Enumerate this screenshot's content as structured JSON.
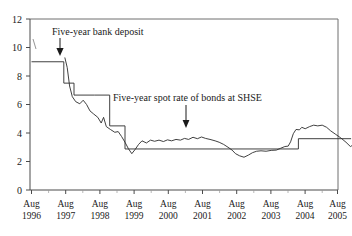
{
  "chart_data": {
    "type": "line",
    "title": "",
    "xlabel": "",
    "ylabel": "",
    "ylim": [
      0,
      12
    ],
    "yticks": [
      0,
      2,
      4,
      6,
      8,
      10,
      12
    ],
    "grid": false,
    "legend_position": "annotations-inline",
    "xlabels_line1": [
      "Aug",
      "Aug",
      "Aug",
      "Aug",
      "Aug",
      "Aug",
      "Aug",
      "Aug",
      "Aug",
      "Aug"
    ],
    "xlabels_line2": [
      "1996",
      "1997",
      "1998",
      "1999",
      "2000",
      "2001",
      "2002",
      "2003",
      "2004",
      "2005"
    ],
    "x_categories": [
      "Aug 1996",
      "Aug 1997",
      "Aug 1998",
      "Aug 1999",
      "Aug 2000",
      "Aug 2001",
      "Aug 2002",
      "Aug 2003",
      "Aug 2004",
      "Aug 2005"
    ],
    "annotations": [
      {
        "name": "five-year-bank-deposit",
        "text": "Five-year bank deposit",
        "arrow": "down"
      },
      {
        "name": "five-year-spot-rate",
        "text": "Five-year spot rate of bonds at SHSE",
        "arrow": "down"
      }
    ],
    "series": [
      {
        "name": "Five-year bank deposit",
        "style": "step",
        "points": [
          [
            0.0,
            9.0
          ],
          [
            0.95,
            9.0
          ],
          [
            0.95,
            7.5
          ],
          [
            1.25,
            7.5
          ],
          [
            1.25,
            6.66
          ],
          [
            1.85,
            6.66
          ],
          [
            1.85,
            6.66
          ],
          [
            2.3,
            6.66
          ],
          [
            2.3,
            4.5
          ],
          [
            2.75,
            4.5
          ],
          [
            2.75,
            2.88
          ],
          [
            7.85,
            2.88
          ],
          [
            7.85,
            3.6
          ],
          [
            9.4,
            3.6
          ]
        ]
      },
      {
        "name": "Five-year spot rate of bonds at SHSE",
        "style": "line",
        "points": [
          [
            0.98,
            9.3
          ],
          [
            1.05,
            8.6
          ],
          [
            1.12,
            7.3
          ],
          [
            1.2,
            6.55
          ],
          [
            1.3,
            6.2
          ],
          [
            1.42,
            6.05
          ],
          [
            1.52,
            6.3
          ],
          [
            1.62,
            6.0
          ],
          [
            1.72,
            5.55
          ],
          [
            1.82,
            5.35
          ],
          [
            1.95,
            5.1
          ],
          [
            2.05,
            4.7
          ],
          [
            2.12,
            5.1
          ],
          [
            2.2,
            4.45
          ],
          [
            2.32,
            4.25
          ],
          [
            2.45,
            4.05
          ],
          [
            2.55,
            4.1
          ],
          [
            2.65,
            3.75
          ],
          [
            2.75,
            3.35
          ],
          [
            2.85,
            2.9
          ],
          [
            2.95,
            2.55
          ],
          [
            3.05,
            2.85
          ],
          [
            3.15,
            3.2
          ],
          [
            3.25,
            3.45
          ],
          [
            3.38,
            3.3
          ],
          [
            3.5,
            3.5
          ],
          [
            3.62,
            3.42
          ],
          [
            3.75,
            3.5
          ],
          [
            3.88,
            3.4
          ],
          [
            4.0,
            3.52
          ],
          [
            4.12,
            3.45
          ],
          [
            4.25,
            3.55
          ],
          [
            4.38,
            3.5
          ],
          [
            4.5,
            3.62
          ],
          [
            4.62,
            3.55
          ],
          [
            4.75,
            3.7
          ],
          [
            4.88,
            3.6
          ],
          [
            5.0,
            3.72
          ],
          [
            5.12,
            3.62
          ],
          [
            5.25,
            3.55
          ],
          [
            5.4,
            3.45
          ],
          [
            5.52,
            3.35
          ],
          [
            5.65,
            3.2
          ],
          [
            5.78,
            3.0
          ],
          [
            5.9,
            2.8
          ],
          [
            6.0,
            2.55
          ],
          [
            6.12,
            2.4
          ],
          [
            6.25,
            2.3
          ],
          [
            6.38,
            2.45
          ],
          [
            6.5,
            2.62
          ],
          [
            6.62,
            2.72
          ],
          [
            6.75,
            2.75
          ],
          [
            6.9,
            2.72
          ],
          [
            7.05,
            2.78
          ],
          [
            7.2,
            2.8
          ],
          [
            7.32,
            2.92
          ],
          [
            7.45,
            3.05
          ],
          [
            7.55,
            3.08
          ],
          [
            7.62,
            3.38
          ],
          [
            7.7,
            3.95
          ],
          [
            7.78,
            4.25
          ],
          [
            7.88,
            4.22
          ],
          [
            7.95,
            4.4
          ],
          [
            8.05,
            4.3
          ],
          [
            8.18,
            4.45
          ],
          [
            8.3,
            4.55
          ],
          [
            8.42,
            4.5
          ],
          [
            8.55,
            4.55
          ],
          [
            8.68,
            4.4
          ],
          [
            8.8,
            4.15
          ],
          [
            8.95,
            3.9
          ],
          [
            9.1,
            3.65
          ],
          [
            9.25,
            3.35
          ],
          [
            9.38,
            3.05
          ],
          [
            9.45,
            3.15
          ]
        ]
      }
    ]
  },
  "figure": {
    "caption_fragment": ""
  }
}
